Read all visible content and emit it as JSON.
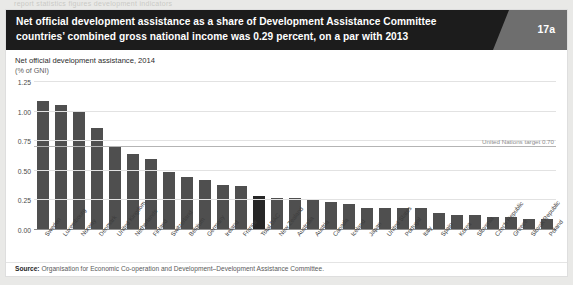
{
  "bleed_text": "report   statistics   figures   development   indicators",
  "header": {
    "title": "Net official development assistance as a share of Development Assistance Committee countries’ combined gross national income was 0.29 percent, on a par with 2013",
    "figure_number": "17a"
  },
  "footer": {
    "source_label": "Source:",
    "source_text": "Organisation for Economic Co-operation and Development–Development Assistance Committee."
  },
  "chart_data": {
    "type": "bar",
    "title": "Net official development assistance, 2014",
    "subtitle": "(% of GNI)",
    "xlabel": "",
    "ylabel": "(% of GNI)",
    "ylim": [
      0,
      1.25
    ],
    "yticks": [
      "0.00",
      "0.25",
      "0.50",
      "0.75",
      "1.00",
      "1.25"
    ],
    "ytick_values": [
      0,
      0.25,
      0.5,
      0.75,
      1.0,
      1.25
    ],
    "grid": true,
    "legend": "none",
    "annotation": {
      "label": "United Nations target 0.70",
      "value": 0.7
    },
    "highlight_category": "Total DAC",
    "colors": {
      "bar": "#4f4f4f",
      "bar_highlight": "#272727",
      "header_bar": "#1c1c1c",
      "header_tab": "#6e6e6e",
      "grid": "#e2e2e2",
      "target_line": "#b4b4b4"
    },
    "categories": [
      "Sweden",
      "Luxembourg",
      "Norway",
      "Denmark",
      "United Kingdom",
      "Netherlands",
      "Finland",
      "Switzerland",
      "Belgium",
      "Germany",
      "Ireland",
      "France",
      "Total DAC",
      "New Zealand",
      "Australia",
      "Austria",
      "Canada",
      "Iceland",
      "Japan",
      "United States",
      "Portugal",
      "Italy",
      "Spain",
      "Korea",
      "Slovenia",
      "Czech Republic",
      "Greece",
      "Slovak Republic",
      "Poland"
    ],
    "values": [
      1.09,
      1.06,
      1.0,
      0.86,
      0.7,
      0.64,
      0.6,
      0.49,
      0.45,
      0.42,
      0.38,
      0.37,
      0.29,
      0.27,
      0.27,
      0.26,
      0.24,
      0.22,
      0.19,
      0.19,
      0.19,
      0.19,
      0.14,
      0.13,
      0.13,
      0.11,
      0.11,
      0.09,
      0.09
    ]
  }
}
